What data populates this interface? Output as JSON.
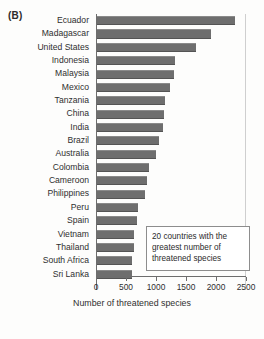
{
  "panel": {
    "label": "(B)"
  },
  "annotation": {
    "line1": "20 countries with the",
    "line2": "greatest number of",
    "line3": "threatened species"
  },
  "chart_data": {
    "type": "bar",
    "orientation": "horizontal",
    "title": "",
    "xlabel": "Number of threatened species",
    "ylabel": "",
    "xlim": [
      0,
      2500
    ],
    "xticks": [
      0,
      500,
      1000,
      1500,
      2000,
      2500
    ],
    "xticklabels": [
      "0",
      "500",
      "1000",
      "1500",
      "2000",
      "2500"
    ],
    "grid": false,
    "legend": null,
    "bar_color": "#6e6e6e",
    "categories": [
      "Ecuador",
      "Madagascar",
      "United States",
      "Indonesia",
      "Malaysia",
      "Mexico",
      "Tanzania",
      "China",
      "India",
      "Brazil",
      "Australia",
      "Colombia",
      "Cameroon",
      "Philippines",
      "Peru",
      "Spain",
      "Vietnam",
      "Thailand",
      "South Africa",
      "Sri Lanka"
    ],
    "values": [
      2300,
      1900,
      1650,
      1300,
      1280,
      1220,
      1130,
      1120,
      1100,
      1030,
      980,
      870,
      840,
      800,
      690,
      670,
      620,
      610,
      590,
      580
    ],
    "annotations": [
      "20 countries with the greatest number of threatened species"
    ]
  }
}
